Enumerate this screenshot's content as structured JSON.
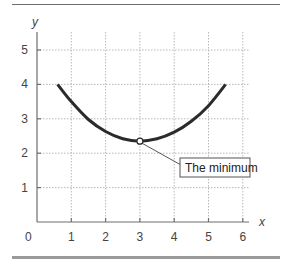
{
  "chart_data": {
    "type": "line",
    "title": "",
    "xlabel": "x",
    "ylabel": "y",
    "xlim": [
      0,
      6.2
    ],
    "ylim": [
      0,
      5.5
    ],
    "grid": true,
    "xticks": [
      0,
      1,
      2,
      3,
      4,
      5,
      6
    ],
    "yticks": [
      1,
      2,
      3,
      4,
      5
    ],
    "origin_label": "0",
    "series": [
      {
        "name": "curve",
        "x": [
          0.6,
          1.0,
          1.5,
          2.0,
          2.5,
          3.0,
          3.5,
          4.0,
          4.5,
          5.0,
          5.5
        ],
        "y": [
          4.0,
          3.5,
          2.98,
          2.63,
          2.42,
          2.35,
          2.42,
          2.61,
          2.93,
          3.38,
          4.0
        ]
      }
    ],
    "annotations": [
      {
        "text": "The minimum",
        "x": 3.0,
        "y": 2.35,
        "marker": "open-circle"
      }
    ],
    "colors": {
      "curve": "#2b2b2b",
      "axis": "#6e6e6e",
      "grid": "#b8b8b8",
      "top_rule": "#6e6e6e",
      "bottom_rule": "#9a9a9a"
    }
  }
}
